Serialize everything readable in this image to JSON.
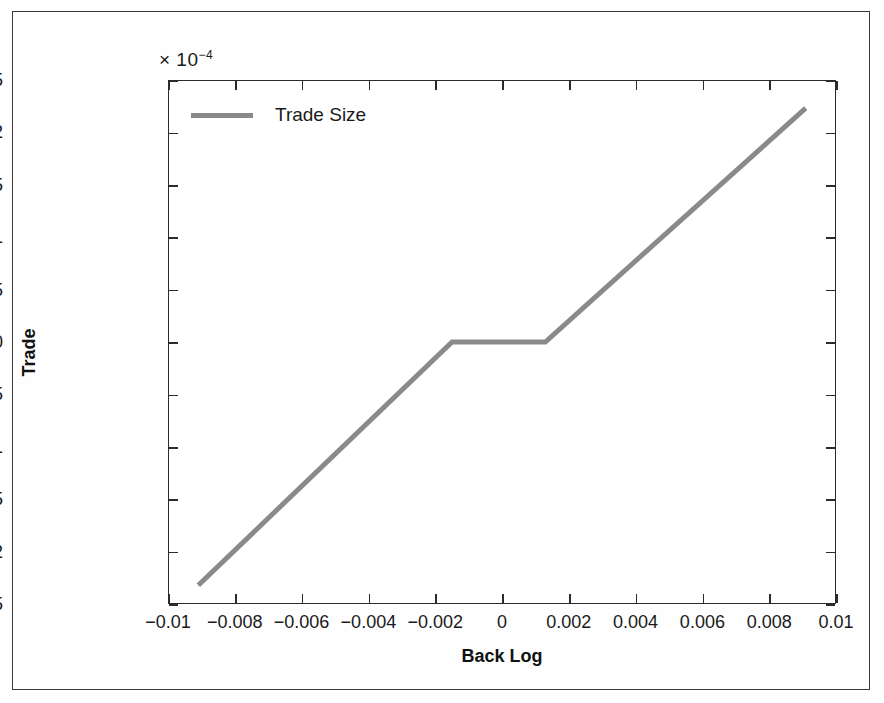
{
  "figure": {
    "exponent_prefix": "× 10",
    "exponent_power": "−4",
    "background_color": "#ffffff",
    "frame_color": "#3a3a3a"
  },
  "legend": {
    "position": "top-left-inside",
    "entries": [
      {
        "label": "Trade Size",
        "color": "#8a8a8a"
      }
    ]
  },
  "chart_data": {
    "type": "line",
    "title": "",
    "subtitle": "",
    "xlabel": "Back Log",
    "ylabel": "Trade",
    "y_multiplier": "× 10⁻⁴",
    "y_scale_factor": 0.0001,
    "xlim": [
      -0.01,
      0.01
    ],
    "ylim": [
      -2.5,
      2.5
    ],
    "xticks": [
      -0.01,
      -0.008,
      -0.006,
      -0.004,
      -0.002,
      0,
      0.002,
      0.004,
      0.006,
      0.008,
      0.01
    ],
    "xtick_labels": [
      "−0.01",
      "−0.008",
      "−0.006",
      "−0.004",
      "−0.002",
      "0",
      "0.002",
      "0.004",
      "0.006",
      "0.008",
      "0.01"
    ],
    "yticks": [
      -2.5,
      -2,
      -1.5,
      -1,
      -0.5,
      0,
      0.5,
      1,
      1.5,
      2,
      2.5
    ],
    "ytick_labels": [
      "−2.5",
      "−2",
      "−1.5",
      "−1",
      "−0.5",
      "0",
      "0.5",
      "1",
      "1.5",
      "2",
      "2.5"
    ],
    "grid": false,
    "legend_position": "upper left",
    "series": [
      {
        "name": "Trade Size",
        "color": "#8a8a8a",
        "line_width": 5,
        "shape": "piecewise-linear dead-zone",
        "x": [
          -0.00912,
          -0.0015,
          0.0013,
          0.00912
        ],
        "values": [
          -2.33,
          0,
          0,
          2.24
        ],
        "points": [
          {
            "x": -0.00912,
            "y": -2.33
          },
          {
            "x": -0.0015,
            "y": 0
          },
          {
            "x": 0.0013,
            "y": 0
          },
          {
            "x": 0.00912,
            "y": 2.24
          }
        ]
      }
    ]
  }
}
